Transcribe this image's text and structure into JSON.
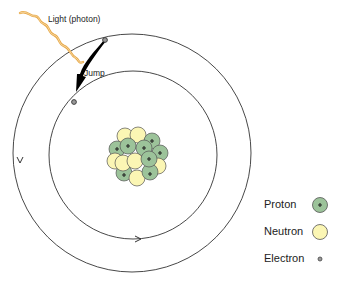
{
  "diagram": {
    "labels": {
      "photon": "Light (photon)",
      "jump": "Jump"
    },
    "legend": [
      {
        "label": "Proton",
        "symbol": "green circle with plus",
        "color": "#9cc39a"
      },
      {
        "label": "Neutron",
        "symbol": "yellow circle",
        "color": "#fbf6b4"
      },
      {
        "label": "Electron",
        "symbol": "small grey dot",
        "color": "#888888"
      }
    ],
    "colors": {
      "proton": "#9cc39a",
      "neutron": "#fbf6b4",
      "photon": "#e8a94a",
      "orbit": "#333333"
    }
  }
}
